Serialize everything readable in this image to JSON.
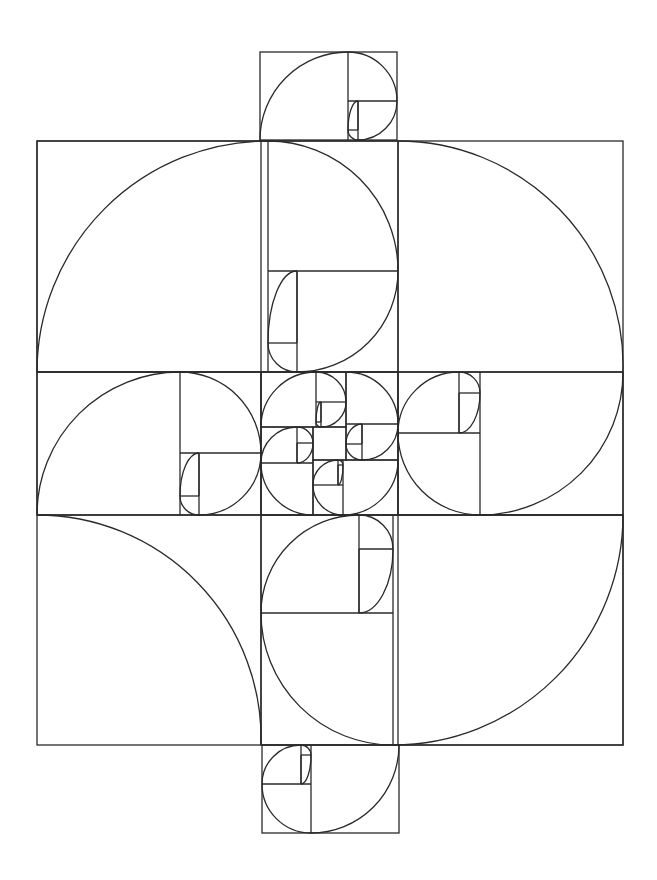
{
  "diagram": {
    "stroke_color": "#2a2a2a",
    "background": "#ffffff",
    "depth": 9,
    "outer_frame": {
      "x": 37,
      "y": 141,
      "w": 586,
      "h": 604
    },
    "lines": [
      {
        "x1": 37,
        "y1": 372,
        "x2": 623,
        "y2": 372
      },
      {
        "x1": 37,
        "y1": 515,
        "x2": 623,
        "y2": 515
      },
      {
        "x1": 261,
        "y1": 141,
        "x2": 261,
        "y2": 745
      },
      {
        "x1": 398,
        "y1": 141,
        "x2": 398,
        "y2": 745
      }
    ],
    "center_square": {
      "x": 313,
      "y": 427,
      "w": 33,
      "h": 33
    },
    "quarter_arcs": [
      {
        "name": "upper-right-arc",
        "cx": 398,
        "cy": 372,
        "r": 225,
        "from": [
          398,
          141
        ],
        "to": [
          623,
          372
        ]
      },
      {
        "name": "lower-left-arc",
        "cx": 261,
        "cy": 515,
        "r": 224,
        "from": [
          37,
          515
        ],
        "to": [
          261,
          745
        ]
      }
    ],
    "spirals": [
      {
        "name": "top-spiral",
        "x": 260,
        "y": 52,
        "w": 137,
        "h": 88,
        "start": "left",
        "dir": "cw"
      },
      {
        "name": "upper-main-spiral",
        "x": 37,
        "y": 141,
        "w": 361,
        "h": 231,
        "start": "left",
        "dir": "cw"
      },
      {
        "name": "left-middle-spiral",
        "x": 37,
        "y": 372,
        "w": 224,
        "h": 143,
        "start": "left",
        "dir": "cw"
      },
      {
        "name": "right-middle-spiral",
        "x": 398,
        "y": 372,
        "w": 225,
        "h": 143,
        "start": "right",
        "dir": "cw"
      },
      {
        "name": "lower-main-spiral",
        "x": 261,
        "y": 515,
        "w": 362,
        "h": 230,
        "start": "right",
        "dir": "cw"
      },
      {
        "name": "bottom-spiral",
        "x": 262,
        "y": 745,
        "w": 137,
        "h": 88,
        "start": "right",
        "dir": "cw"
      },
      {
        "name": "center-top-spiral",
        "x": 261,
        "y": 372,
        "w": 85,
        "h": 55,
        "start": "left",
        "dir": "cw"
      },
      {
        "name": "center-right-spiral",
        "x": 346,
        "y": 372,
        "w": 52,
        "h": 88,
        "start": "top",
        "dir": "cw"
      },
      {
        "name": "center-bottom-spiral",
        "x": 313,
        "y": 460,
        "w": 85,
        "h": 55,
        "start": "right",
        "dir": "cw"
      },
      {
        "name": "center-left-spiral",
        "x": 261,
        "y": 427,
        "w": 52,
        "h": 88,
        "start": "bottom",
        "dir": "cw"
      }
    ]
  }
}
